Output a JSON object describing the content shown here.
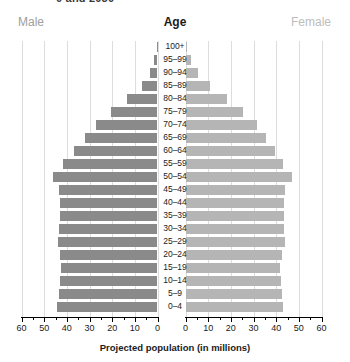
{
  "title_sliver": "0 and 2050",
  "header": {
    "male_label": "Male",
    "age_label": "Age",
    "female_label": "Female"
  },
  "axis": {
    "xlabel": "Projected population (in millions)",
    "left_ticks": [
      "60",
      "50",
      "40",
      "30",
      "20",
      "10",
      "0"
    ],
    "right_ticks": [
      "0",
      "10",
      "20",
      "30",
      "40",
      "50",
      "60"
    ]
  },
  "colors": {
    "male_bar": "#8a8a8a",
    "female_bar": "#b5b5b5",
    "gridline": "#dcdcdc",
    "axis": "#000000",
    "male_label": "#9e9e9e",
    "female_label": "#bdbdbd"
  },
  "chart_data": {
    "type": "bar",
    "subtype": "population-pyramid",
    "xlabel": "Projected population (in millions)",
    "ylabel": "Age",
    "xlim": [
      0,
      60
    ],
    "xticks": [
      0,
      10,
      20,
      30,
      40,
      50,
      60
    ],
    "minor_tick_step": 5,
    "grid": true,
    "grid_axis": "x",
    "legend": [
      "Male",
      "Female"
    ],
    "legend_position": "top",
    "orientation": "horizontal",
    "categories": [
      "100+",
      "95–99",
      "90–94",
      "85–89",
      "80–84",
      "75–79",
      "70–74",
      "65–69",
      "60–64",
      "55–59",
      "50–54",
      "45–49",
      "40–44",
      "35–39",
      "30–34",
      "25–29",
      "20–24",
      "15–19",
      "10–14",
      "5–9",
      "0–4"
    ],
    "series": [
      {
        "name": "Male",
        "color": "#8a8a8a",
        "direction": "left",
        "values": [
          0.3,
          1.4,
          3.2,
          7.0,
          13.5,
          20.5,
          27.0,
          32.0,
          37.0,
          41.5,
          46.0,
          43.5,
          43.0,
          43.0,
          43.5,
          44.0,
          43.0,
          42.5,
          43.0,
          43.5,
          44.5
        ]
      },
      {
        "name": "Female",
        "color": "#b5b5b5",
        "direction": "right",
        "values": [
          0.6,
          2.6,
          5.6,
          11.0,
          18.5,
          25.5,
          31.5,
          35.5,
          39.5,
          43.0,
          47.0,
          44.0,
          43.5,
          43.5,
          43.5,
          44.0,
          42.5,
          41.5,
          42.0,
          42.5,
          43.0
        ]
      }
    ]
  }
}
